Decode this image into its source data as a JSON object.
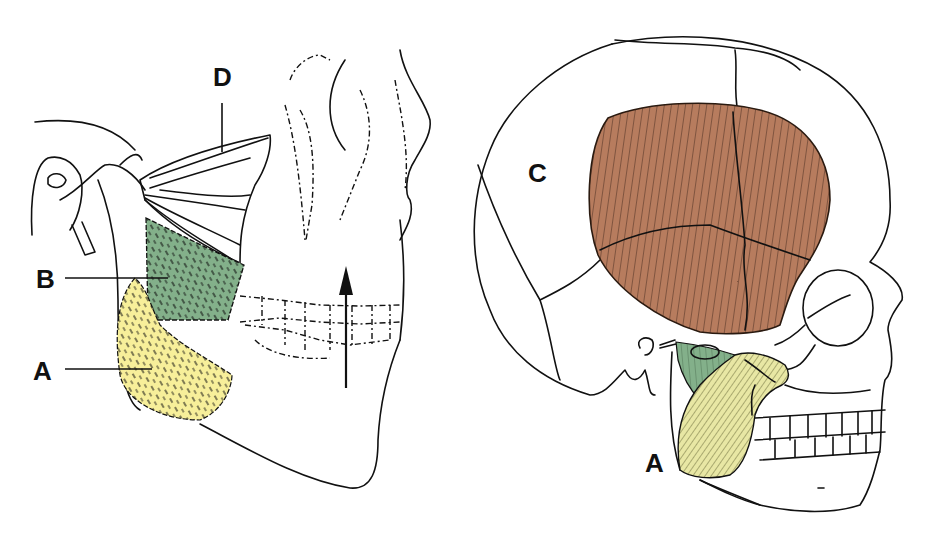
{
  "figure": {
    "panels": [
      {
        "id": "left",
        "description": "Lateral view of mandible with muscles of mastication (deep view)",
        "labels": [
          {
            "letter": "D",
            "x": 226,
            "y": 84
          },
          {
            "letter": "B",
            "x": 46,
            "y": 284
          },
          {
            "letter": "A",
            "x": 42,
            "y": 378
          }
        ],
        "arrow": {
          "direction": "up",
          "meaning": "jaw elevation"
        }
      },
      {
        "id": "right",
        "description": "Lateral view of skull with temporalis and masseter",
        "labels": [
          {
            "letter": "C",
            "x": 540,
            "y": 180
          },
          {
            "letter": "A",
            "x": 655,
            "y": 470
          }
        ]
      }
    ],
    "colors": {
      "masseter": "#f7ef9a",
      "pterygoid": "#7fad84",
      "temporalis": "#b77c5e",
      "masseter_right": "#e8e7a4",
      "outline": "#111111"
    }
  }
}
